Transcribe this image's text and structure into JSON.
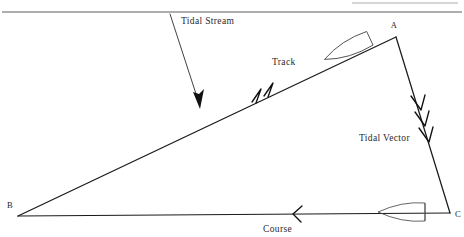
{
  "figure": {
    "kind": "navigation-vector-triangle",
    "background_color": "#ffffff",
    "line_color": "#1a1a1a",
    "label_color": "#2a2a2a",
    "hull_color": "#4a4a4a",
    "rule_color": "#5c5c5c"
  },
  "top_rule": {
    "present": true,
    "y": 12
  },
  "vertices": [
    {
      "id": "A",
      "label": "A",
      "x": 396,
      "y": 37,
      "label_x": 396,
      "label_y": 27
    },
    {
      "id": "B",
      "label": "B",
      "x": 18,
      "y": 216,
      "label_x": 7,
      "label_y": 206
    },
    {
      "id": "C",
      "label": "C",
      "x": 450,
      "y": 213,
      "label_x": 455,
      "label_y": 214
    }
  ],
  "edges": [
    {
      "id": "track",
      "label": "Track",
      "from": "B",
      "to": "A",
      "x1": 18,
      "y1": 216,
      "x2": 396,
      "y2": 37,
      "chevron_count": 2,
      "direction": "B-to-A",
      "label_x": 272,
      "label_y": 65
    },
    {
      "id": "tidal-vector",
      "label": "Tidal Vector",
      "from": "A",
      "to": "C",
      "x1": 396,
      "y1": 37,
      "x2": 450,
      "y2": 213,
      "chevron_count": 3,
      "direction": "A-to-C",
      "label_x": 359,
      "label_y": 141
    },
    {
      "id": "course",
      "label": "Course",
      "from": "C",
      "to": "B",
      "x1": 450,
      "y1": 213,
      "x2": 18,
      "y2": 216,
      "chevron_count": 1,
      "direction": "C-to-B",
      "label_x": 263,
      "label_y": 232
    }
  ],
  "tidal_stream_arrow": {
    "label": "Tidal Stream",
    "x1": 170,
    "y1": 14,
    "x2": 200,
    "y2": 108,
    "label_x": 181,
    "label_y": 24
  },
  "boats": [
    {
      "id": "boat-at-a",
      "position_label": "near A on track",
      "cx": 349,
      "cy": 48,
      "length": 54,
      "beam": 19,
      "rotation": -25
    },
    {
      "id": "boat-at-c",
      "position_label": "near C on course",
      "cx": 404,
      "cy": 212,
      "length": 52,
      "beam": 19,
      "rotation": 180
    }
  ]
}
